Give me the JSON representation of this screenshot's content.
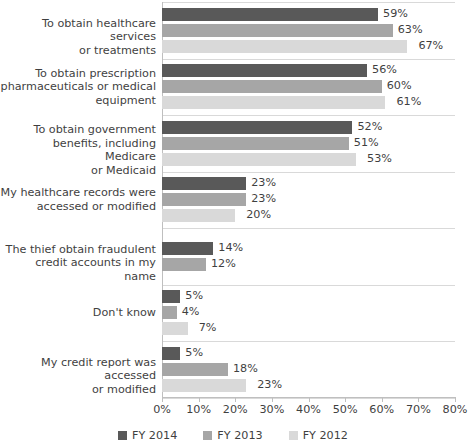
{
  "chart_data": {
    "type": "bar",
    "orientation": "horizontal",
    "title": "",
    "subtitle": "",
    "xlabel": "",
    "ylabel": "",
    "xlim": [
      0,
      80
    ],
    "xticks": [
      "0%",
      "10%",
      "20%",
      "30%",
      "40%",
      "50%",
      "60%",
      "70%",
      "80%"
    ],
    "xtick_values": [
      0,
      10,
      20,
      30,
      40,
      50,
      60,
      70,
      80
    ],
    "grid": true,
    "grid_axis": "category-separators",
    "legend_position": "bottom-center",
    "value_label_format": "{v}%",
    "categories": [
      "To obtain healthcare services or treatments",
      "To obtain prescription pharmaceuticals or medical equipment",
      "To obtain government benefits, including Medicare or Medicaid",
      "My healthcare records were accessed or modified",
      "The thief obtain fraudulent credit accounts in my name",
      "Don't know",
      "My credit report was accessed or modified"
    ],
    "category_lines": [
      [
        "To obtain healthcare services",
        "or treatments"
      ],
      [
        "To obtain prescription",
        "pharmaceuticals or medical",
        "equipment"
      ],
      [
        "To obtain government",
        "benefits, including Medicare",
        "or Medicaid"
      ],
      [
        "My healthcare records were",
        "accessed or modified"
      ],
      [
        "The thief obtain fraudulent",
        "credit accounts in my name"
      ],
      [
        "Don't know"
      ],
      [
        "My credit report was accessed",
        "or modified"
      ]
    ],
    "series": [
      {
        "name": "FY 2014",
        "color": "#595959",
        "values": [
          59,
          56,
          52,
          23,
          14,
          5,
          5
        ],
        "labels": [
          "59%",
          "56%",
          "52%",
          "23%",
          "14%",
          "5%",
          "5%"
        ]
      },
      {
        "name": "FY 2013",
        "color": "#a6a6a6",
        "values": [
          63,
          60,
          51,
          23,
          12,
          4,
          18
        ],
        "labels": [
          "63%",
          "60%",
          "51%",
          "23%",
          "12%",
          "4%",
          "18%"
        ]
      },
      {
        "name": "FY 2012",
        "color": "#d9d9d9",
        "values": [
          67,
          61,
          53,
          20,
          null,
          7,
          23
        ],
        "labels": [
          "67%",
          "61%",
          "53%",
          "20%",
          "",
          "7%",
          "23%"
        ]
      }
    ]
  },
  "legend": {
    "items": [
      {
        "label": "FY 2014",
        "color": "#595959"
      },
      {
        "label": "FY 2013",
        "color": "#a6a6a6"
      },
      {
        "label": "FY 2012",
        "color": "#d9d9d9"
      }
    ]
  },
  "axis": {
    "x_tick_labels": [
      "0%",
      "10%",
      "20%",
      "30%",
      "40%",
      "50%",
      "60%",
      "70%",
      "80%"
    ]
  }
}
